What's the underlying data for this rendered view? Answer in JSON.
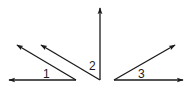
{
  "colors": {
    "stroke": "#1a1a1a",
    "background": "#ffffff"
  },
  "angles": [
    {
      "id": "angle-1",
      "label": "1",
      "type": "acute",
      "rays": [
        "left",
        "upper-left"
      ]
    },
    {
      "id": "angle-2",
      "label": "2",
      "type": "acute",
      "rays": [
        "up",
        "upper-left"
      ]
    },
    {
      "id": "angle-3",
      "label": "3",
      "type": "acute",
      "rays": [
        "right",
        "upper-right"
      ]
    }
  ]
}
